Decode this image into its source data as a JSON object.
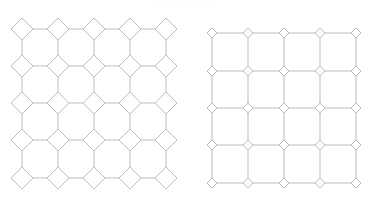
{
  "captions": {
    "top": "· · ·    · ·       · ·   · · ·",
    "bottom": "· · ·"
  },
  "style": {
    "stroke": "#bdbdbd",
    "fill": "#ffffff"
  },
  "left_diagram": {
    "name": "octagon-diamond-tiling",
    "cols_x": [
      22,
      58,
      94,
      130,
      166
    ],
    "rows_y": [
      29,
      66,
      103,
      140,
      178
    ],
    "diamond_half": 11
  },
  "right_diagram": {
    "name": "square-grid-with-diamond-nodes",
    "cols_x": [
      212,
      248,
      284,
      320,
      356
    ],
    "rows_y": [
      33,
      71,
      108,
      145,
      183
    ],
    "diamond_half": 5
  }
}
